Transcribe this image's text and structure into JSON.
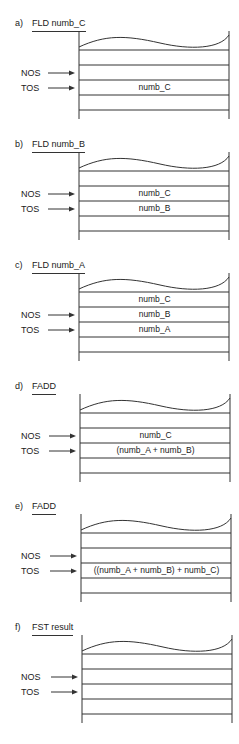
{
  "figure": {
    "pointers": {
      "nos_label": "NOS",
      "tos_label": "TOS"
    },
    "panels": [
      {
        "letter": "a)",
        "instruction": "FLD numb_C",
        "rows": [
          "",
          "",
          "",
          "numb_C",
          "",
          ""
        ]
      },
      {
        "letter": "b)",
        "instruction": "FLD numb_B",
        "rows": [
          "",
          "",
          "numb_C",
          "numb_B",
          "",
          ""
        ]
      },
      {
        "letter": "c)",
        "instruction": "FLD numb_A",
        "rows": [
          "",
          "numb_C",
          "numb_B",
          "numb_A",
          "",
          ""
        ]
      },
      {
        "letter": "d)",
        "instruction": "FADD",
        "rows": [
          "",
          "",
          "numb_C",
          "(numb_A + numb_B)",
          "",
          ""
        ]
      },
      {
        "letter": "e)",
        "instruction": "FADD",
        "rows": [
          "",
          "",
          "",
          "((numb_A + numb_B) + numb_C)",
          "",
          ""
        ]
      },
      {
        "letter": "f)",
        "instruction": "FST result",
        "rows": [
          "",
          "",
          "",
          "",
          "",
          ""
        ]
      }
    ]
  },
  "colors": {
    "line": "#333333",
    "text": "#1a1a1a",
    "background": "#ffffff"
  }
}
